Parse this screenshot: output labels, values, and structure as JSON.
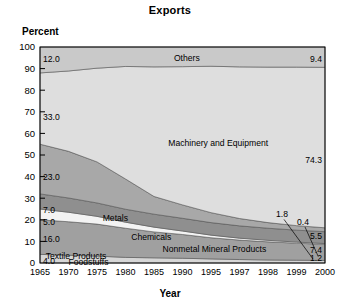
{
  "chart_data": {
    "type": "area",
    "title": "Exports",
    "xlabel": "Year",
    "ylabel": "Percent",
    "ylim": [
      0,
      100
    ],
    "grid": false,
    "legend_position": "none",
    "x": [
      1965,
      1970,
      1975,
      1980,
      1985,
      1990,
      1995,
      1997,
      1998,
      1999,
      2000
    ],
    "xtick_labels": [
      "1965",
      "1970",
      "1975",
      "1980",
      "1985",
      "1990",
      "1995",
      "1997",
      "1998",
      "1999",
      "2000"
    ],
    "ytick_labels": [
      "0",
      "10",
      "20",
      "30",
      "40",
      "50",
      "60",
      "70",
      "80",
      "90",
      "100"
    ],
    "ytick_values": [
      0,
      10,
      20,
      30,
      40,
      50,
      60,
      70,
      80,
      90,
      100
    ],
    "stack_order_bottom_to_top": [
      "Foodstuffs",
      "Textile Products",
      "Nonmetal Mineral Products",
      "Chemicals",
      "Metals",
      "Machinery and Equipment",
      "Others"
    ],
    "series": [
      {
        "name": "Foodstuffs",
        "start_value": 4.0,
        "end_value": 1.2,
        "values": [
          4.0,
          3.6,
          3.2,
          2.6,
          2.4,
          2.2,
          1.9,
          1.6,
          1.4,
          1.3,
          1.2
        ]
      },
      {
        "name": "Textile Products",
        "start_value": 16.0,
        "end_value": 7.4,
        "values": [
          16.0,
          15.5,
          14.8,
          13.5,
          12.0,
          11.0,
          9.8,
          9.0,
          8.4,
          7.9,
          7.4
        ]
      },
      {
        "name": "Nonmetal Mineral Products",
        "start_value": 5.0,
        "end_value": 0.4,
        "values": [
          5.0,
          4.4,
          3.6,
          2.8,
          2.2,
          1.6,
          1.2,
          0.9,
          0.7,
          0.5,
          0.4
        ]
      },
      {
        "name": "Chemicals",
        "start_value": 7.0,
        "end_value": 5.5,
        "values": [
          7.0,
          6.6,
          6.2,
          6.0,
          6.0,
          5.9,
          5.8,
          5.7,
          5.6,
          5.5,
          5.5
        ]
      },
      {
        "name": "Metals",
        "start_value": 23.0,
        "end_value": 1.8,
        "values": [
          23.0,
          21.6,
          19.0,
          14.0,
          8.2,
          6.2,
          4.6,
          3.4,
          2.6,
          2.1,
          1.8
        ]
      },
      {
        "name": "Machinery and Equipment",
        "start_value": 33.0,
        "end_value": 74.3,
        "values": [
          33.0,
          37.2,
          43.4,
          52.1,
          60.0,
          64.0,
          67.8,
          70.2,
          72.0,
          73.4,
          74.3
        ]
      },
      {
        "name": "Others",
        "start_value": 12.0,
        "end_value": 9.4,
        "values": [
          12.0,
          11.1,
          9.8,
          9.0,
          9.2,
          9.1,
          8.9,
          9.2,
          9.3,
          9.3,
          9.4
        ]
      }
    ],
    "band_labels": [
      {
        "text": "Others",
        "x_pct": 0.47,
        "y_value": 95.0
      },
      {
        "text": "Machinery and Equipment",
        "x_pct": 0.45,
        "y_value": 55.5
      },
      {
        "text": "Metals",
        "x_pct": 0.22,
        "y_value": 21.0
      },
      {
        "text": "Chemicals",
        "x_pct": 0.32,
        "y_value": 12.2
      },
      {
        "text": "Nonmetal Mineral Products",
        "x_pct": 0.43,
        "y_value": 6.5
      },
      {
        "text": "Textile Products",
        "x_pct": 0.02,
        "y_value": 3.1
      },
      {
        "text": "Foodstuffs",
        "x_pct": 0.1,
        "y_value": 0.6
      }
    ],
    "start_value_labels": [
      {
        "text": "12.0",
        "y_value": 94.5
      },
      {
        "text": "33.0",
        "y_value": 67.5
      },
      {
        "text": "23.0",
        "y_value": 40.0
      },
      {
        "text": "7.0",
        "y_value": 24.5
      },
      {
        "text": "5.0",
        "y_value": 19.0
      },
      {
        "text": "16.0",
        "y_value": 11.0
      },
      {
        "text": "4.0",
        "y_value": 0.8
      }
    ],
    "end_value_labels": [
      {
        "text": "9.4",
        "y_value": 94.5
      },
      {
        "text": "74.3",
        "y_value": 47.5
      },
      {
        "text": "5.5",
        "y_value": 12.6
      },
      {
        "text": "7.4",
        "y_value": 5.8
      },
      {
        "text": "1.2",
        "y_value": 2.4
      }
    ],
    "callout_labels": [
      {
        "text": "1.8",
        "y_value": 22.5
      },
      {
        "text": "0.4",
        "y_value": 19.0
      }
    ]
  },
  "colors": {
    "others": "#c9c9c9",
    "machinery": "#dedede",
    "metals": "#a8a8a8",
    "chemicals": "#8f8f8f",
    "nonmetal": "#f3f3f3",
    "textile": "#a0a0a0",
    "foodstuffs": "#d6d6d6",
    "axis": "#000000",
    "plot_background": "#e8e8e8"
  }
}
